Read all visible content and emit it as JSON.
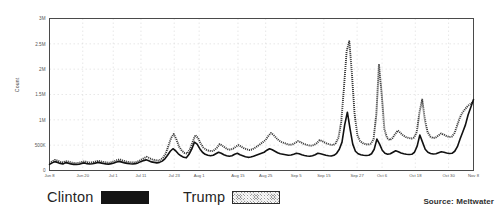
{
  "chart_data": {
    "type": "line",
    "title": "",
    "subtitle": "",
    "xlabel": "",
    "ylabel": "Count",
    "ylim": [
      0,
      3000000
    ],
    "grid": true,
    "legend_position": "bottom-left",
    "ytick_labels": [
      "3M",
      "2.5M",
      "2M",
      "1.5M",
      "1M",
      "500K",
      "0"
    ],
    "ytick_values": [
      3000000,
      2500000,
      2000000,
      1500000,
      1000000,
      500000,
      0
    ],
    "xtick_labels": [
      "Jun 8",
      "Jun 20",
      "Jul 1",
      "Jul 11",
      "Jul 23",
      "Aug 1",
      "Aug 15",
      "Aug 25",
      "Sep 5",
      "Sep 15",
      "Sep 27",
      "Oct 6",
      "Oct 18",
      "Oct 30",
      "Nov 8"
    ],
    "xtick_positions": [
      0,
      12,
      23,
      33,
      45,
      54,
      68,
      78,
      89,
      99,
      111,
      120,
      132,
      144,
      153
    ],
    "x_range": [
      0,
      153
    ],
    "series": [
      {
        "name": "Clinton",
        "color": "#111111",
        "style": "solid",
        "values": [
          120000,
          150000,
          175000,
          160000,
          140000,
          130000,
          155000,
          145000,
          130000,
          120000,
          118000,
          125000,
          140000,
          150000,
          135000,
          128000,
          132000,
          145000,
          160000,
          150000,
          138000,
          130000,
          125000,
          135000,
          150000,
          168000,
          180000,
          165000,
          150000,
          140000,
          132000,
          128000,
          135000,
          150000,
          175000,
          195000,
          210000,
          190000,
          170000,
          160000,
          150000,
          160000,
          185000,
          230000,
          300000,
          380000,
          430000,
          390000,
          330000,
          290000,
          260000,
          250000,
          320000,
          420000,
          560000,
          520000,
          430000,
          360000,
          320000,
          300000,
          290000,
          300000,
          330000,
          360000,
          340000,
          310000,
          290000,
          280000,
          290000,
          320000,
          340000,
          310000,
          290000,
          270000,
          260000,
          265000,
          280000,
          300000,
          320000,
          340000,
          360000,
          400000,
          430000,
          410000,
          380000,
          350000,
          330000,
          320000,
          310000,
          300000,
          305000,
          320000,
          340000,
          330000,
          310000,
          295000,
          285000,
          280000,
          290000,
          310000,
          340000,
          330000,
          315000,
          300000,
          290000,
          285000,
          300000,
          340000,
          420000,
          560000,
          900000,
          1150000,
          820000,
          520000,
          380000,
          330000,
          310000,
          300000,
          295000,
          300000,
          330000,
          420000,
          620000,
          520000,
          400000,
          340000,
          320000,
          330000,
          360000,
          390000,
          370000,
          345000,
          330000,
          320000,
          315000,
          320000,
          360000,
          480000,
          700000,
          560000,
          420000,
          360000,
          335000,
          325000,
          330000,
          350000,
          370000,
          360000,
          345000,
          335000,
          340000,
          380000,
          470000,
          620000,
          760000,
          900000,
          1100000,
          1250000,
          1400000
        ]
      },
      {
        "name": "Trump",
        "color": "#4a4a4a",
        "style": "hatched",
        "values": [
          140000,
          180000,
          210000,
          195000,
          170000,
          160000,
          185000,
          175000,
          158000,
          148000,
          145000,
          152000,
          170000,
          182000,
          165000,
          155000,
          160000,
          175000,
          192000,
          180000,
          168000,
          158000,
          152000,
          165000,
          182000,
          205000,
          220000,
          200000,
          182000,
          170000,
          160000,
          156000,
          165000,
          185000,
          215000,
          245000,
          270000,
          245000,
          220000,
          205000,
          195000,
          210000,
          250000,
          330000,
          480000,
          640000,
          720000,
          610000,
          470000,
          390000,
          345000,
          335000,
          420000,
          560000,
          700000,
          640000,
          530000,
          450000,
          410000,
          390000,
          380000,
          400000,
          450000,
          520000,
          490000,
          450000,
          420000,
          410000,
          430000,
          470000,
          500000,
          470000,
          440000,
          420000,
          405000,
          415000,
          445000,
          480000,
          520000,
          560000,
          600000,
          680000,
          740000,
          700000,
          640000,
          590000,
          560000,
          540000,
          520000,
          505000,
          515000,
          545000,
          580000,
          560000,
          530000,
          510000,
          495000,
          490000,
          505000,
          540000,
          600000,
          580000,
          550000,
          525000,
          510000,
          500000,
          540000,
          650000,
          950000,
          1600000,
          2350000,
          2550000,
          1900000,
          1100000,
          700000,
          580000,
          540000,
          520000,
          510000,
          530000,
          620000,
          1100000,
          2100000,
          1500000,
          820000,
          640000,
          600000,
          640000,
          720000,
          790000,
          740000,
          690000,
          660000,
          640000,
          630000,
          650000,
          760000,
          1150000,
          1400000,
          1000000,
          760000,
          670000,
          640000,
          650000,
          690000,
          730000,
          710000,
          680000,
          660000,
          670000,
          740000,
          900000,
          1050000,
          1150000,
          1220000,
          1280000,
          1320000,
          1360000
        ]
      }
    ]
  },
  "legend": {
    "entries": [
      {
        "label": "Clinton",
        "swatch": "solid-black-swatch"
      },
      {
        "label": "Trump",
        "swatch": "hatched-gray-swatch"
      }
    ]
  },
  "footer": {
    "source": "Source: Meltwater"
  }
}
